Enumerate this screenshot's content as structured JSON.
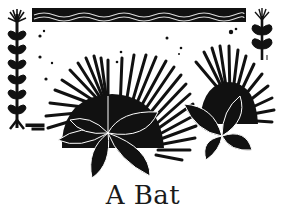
{
  "illustration": {
    "style": "black-and-white woodcut",
    "ink_color": "#111111",
    "paper_color": "#ffffff",
    "elements": {
      "top_band": "wavy-water-band",
      "left_ornament": "tall-leafy-sprig",
      "right_ornament": "short-leafy-sprig",
      "center": "radiating-sea-urchin-plants-with-leaves"
    }
  },
  "title": {
    "text": "A Bat"
  }
}
